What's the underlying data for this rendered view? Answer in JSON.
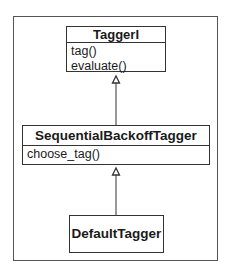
{
  "diagram": {
    "type": "uml-class-hierarchy",
    "classes": [
      {
        "name": "TaggerI",
        "methods": [
          "tag()",
          "evaluate()"
        ]
      },
      {
        "name": "SequentialBackoffTagger",
        "methods": [
          "choose_tag()"
        ]
      },
      {
        "name": "DefaultTagger",
        "methods": []
      }
    ],
    "relations": [
      {
        "from": "SequentialBackoffTagger",
        "to": "TaggerI",
        "kind": "inheritance"
      },
      {
        "from": "DefaultTagger",
        "to": "SequentialBackoffTagger",
        "kind": "inheritance"
      }
    ]
  }
}
